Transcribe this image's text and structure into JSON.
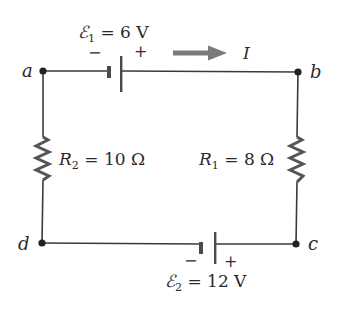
{
  "diagram": {
    "type": "circuit",
    "nodes": [
      {
        "id": "a",
        "label": "a"
      },
      {
        "id": "b",
        "label": "b"
      },
      {
        "id": "c",
        "label": "c"
      },
      {
        "id": "d",
        "label": "d"
      }
    ],
    "emf1": {
      "symbol": "ℰ",
      "subscript": "1",
      "equals": " = ",
      "value": "6 V",
      "minus": "−",
      "plus": "+"
    },
    "emf2": {
      "symbol": "ℰ",
      "subscript": "2",
      "equals": " = ",
      "value": "12 V",
      "minus": "−",
      "plus": "+"
    },
    "r1": {
      "symbol": "R",
      "subscript": "1",
      "equals": " = ",
      "value": "8 Ω"
    },
    "r2": {
      "symbol": "R",
      "subscript": "2",
      "equals": " = ",
      "value": "10 Ω"
    },
    "current": {
      "label": "I",
      "direction": "right"
    },
    "colors": {
      "wire": "#3a3a3a",
      "resistor": "#555555",
      "arrow": "#7a7a7a",
      "text": "#2a2a2a",
      "background": "#ffffff"
    }
  }
}
